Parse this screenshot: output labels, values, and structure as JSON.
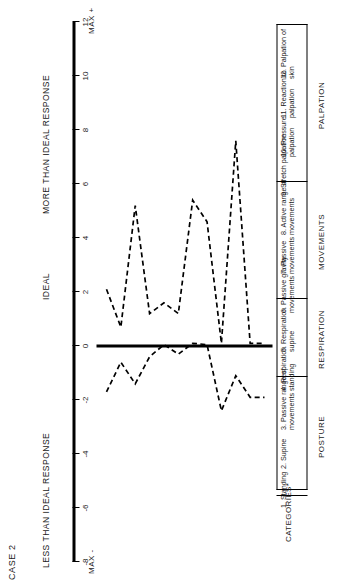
{
  "figure": {
    "case_label": "CASE 2",
    "categories_header": "CATEGORIES*"
  },
  "axis": {
    "label_less": "LESS THAN IDEAL RESPONSE",
    "label_ideal": "IDEAL",
    "label_more": "MORE THAN IDEAL RESPONSE",
    "max_negative": "MAX -",
    "max_positive": "MAX +",
    "ticks": [
      "-8",
      "-6",
      "-4",
      "-2",
      "0",
      "2",
      "4",
      "6",
      "8",
      "10",
      "12"
    ]
  },
  "groups": [
    {
      "label": "POSTURE",
      "start": 1,
      "end": 3
    },
    {
      "label": "RESPIRATION",
      "start": 4,
      "end": 5
    },
    {
      "label": "MOVEMENTS",
      "start": 6,
      "end": 8
    },
    {
      "label": "PALPATION",
      "start": 9,
      "end": 12
    }
  ],
  "chart_data": {
    "type": "line",
    "title": "CASE 2",
    "xlabel": "CATEGORIES*",
    "ylabel": "IDEAL",
    "ylim": [
      -8,
      12
    ],
    "grid": false,
    "legend": false,
    "orientation": "rotated-90ccw",
    "categories": [
      "1. Standing",
      "2. Supine",
      "3. Passive range of movements",
      "4. Respiration standing",
      "5. Respiration supine",
      "6. Passive gravity movements",
      "7. Passive movements",
      "8. Active range of movements",
      "9. Stretch palpation",
      "10. Pressure palpation",
      "11. Reaction to palpation",
      "12. Palpation of skin"
    ],
    "series": [
      {
        "name": "More than ideal response",
        "style": "dashed",
        "values": [
          2.1,
          0.7,
          5.2,
          1.2,
          1.6,
          1.2,
          5.4,
          4.6,
          0.1,
          7.6,
          0.1,
          0.1
        ]
      },
      {
        "name": "Less than ideal response",
        "style": "dashed",
        "values": [
          -1.7,
          -0.6,
          -1.4,
          -0.4,
          0.05,
          -0.3,
          0.1,
          0.05,
          -2.4,
          -1.1,
          -1.9,
          -1.9
        ]
      }
    ],
    "zero_reference_line": 0
  },
  "category_items": [
    {
      "num": "1.",
      "text": "Standing"
    },
    {
      "num": "2.",
      "text": "Supine"
    },
    {
      "num": "3.",
      "text": "Passive range of movements"
    },
    {
      "num": "4.",
      "text": "Respiration standing"
    },
    {
      "num": "5.",
      "text": "Respiration supine"
    },
    {
      "num": "6.",
      "text": "Passive gravity movements"
    },
    {
      "num": "7.",
      "text": "Passive movements"
    },
    {
      "num": "8.",
      "text": "Active range of movements"
    },
    {
      "num": "9.",
      "text": "Stretch palpation"
    },
    {
      "num": "10.",
      "text": "Pressure palpation"
    },
    {
      "num": "11.",
      "text": "Reaction to palpation"
    },
    {
      "num": "12.",
      "text": "Palpation of skin"
    }
  ],
  "colors": {
    "ink": "#111111",
    "axis": "#000000",
    "series": "#000000"
  }
}
